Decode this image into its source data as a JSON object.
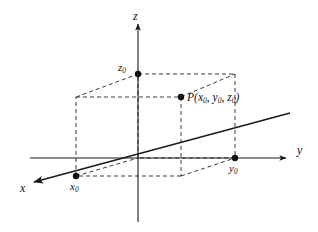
{
  "figure": {
    "name": "3d-cartesian-coordinate-point-diagram",
    "background_color": "#ffffff",
    "line_color": "#1a1a1a",
    "dash_color": "#3a3a3a"
  },
  "axes": [
    {
      "key": "x",
      "label": "x",
      "direction": "down-left",
      "label_x": 22,
      "label_y": 188
    },
    {
      "key": "y",
      "label": "y",
      "direction": "right",
      "label_x": 298,
      "label_y": 150
    },
    {
      "key": "z",
      "label": "z",
      "direction": "up",
      "label_x": 133,
      "label_y": 12
    }
  ],
  "points": [
    {
      "key": "x0",
      "label_main": "x",
      "label_sub": "0",
      "cx": 76,
      "cy": 176,
      "label_x": 70,
      "label_y": 181
    },
    {
      "key": "y0",
      "label_main": "y",
      "label_sub": "0",
      "cx": 235,
      "cy": 158,
      "label_x": 229,
      "label_y": 163
    },
    {
      "key": "z0",
      "label_main": "z",
      "label_sub": "0",
      "cx": 138,
      "cy": 74,
      "label_x": 118,
      "label_y": 62
    },
    {
      "key": "P",
      "label_main": "P",
      "label_sub": "",
      "cx": 181,
      "cy": 97,
      "label_x": 187,
      "label_y": 93
    }
  ],
  "point_label": {
    "name": "P",
    "open_paren": "(",
    "coord1_main": "x",
    "coord1_sub": "0",
    "sep1": ", ",
    "coord2_main": "y",
    "coord2_sub": "0",
    "sep2": ", ",
    "coord3_main": "z",
    "coord3_sub": "0",
    "close_paren": ")",
    "full_text": "P(x0, y0, z0)"
  },
  "geometry": {
    "origin": {
      "x": 138,
      "y": 158
    },
    "z_axis": {
      "x1": 138,
      "y1": 22,
      "x2": 138,
      "y2": 222
    },
    "y_axis": {
      "x1": 30,
      "y1": 158,
      "x2": 290,
      "y2": 158
    },
    "x_ray": {
      "x1": 290,
      "y1": 113,
      "x2": 32,
      "y2": 183
    },
    "box": {
      "front_bottom_left": {
        "x": 76,
        "y": 176
      },
      "front_bottom_right": {
        "x": 181,
        "y": 176
      },
      "front_top_left": {
        "x": 76,
        "y": 97
      },
      "front_top_right": {
        "x": 181,
        "y": 97
      },
      "back_bottom_left": {
        "x": 138,
        "y": 158
      },
      "back_bottom_right": {
        "x": 235,
        "y": 158
      },
      "back_top_left": {
        "x": 138,
        "y": 74
      },
      "back_top_right": {
        "x": 235,
        "y": 74
      }
    }
  }
}
